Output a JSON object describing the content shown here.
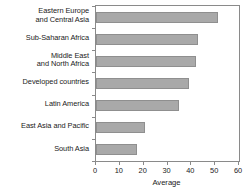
{
  "chart_data": {
    "type": "bar",
    "orientation": "horizontal",
    "title": "",
    "subtitle": "",
    "xlabel": "Average",
    "ylabel": "",
    "categories": [
      "Eastern Europe\nand Central Asia",
      "Sub-Saharan Africa",
      "Middle East\nand North Africa",
      "Developed countries",
      "Latin America",
      "East Asia and Pacific",
      "South Asia"
    ],
    "values": [
      51,
      43,
      42,
      39,
      35,
      20.5,
      17
    ],
    "xlim": [
      0,
      60
    ],
    "xticks": [
      0,
      10,
      20,
      30,
      40,
      50,
      60
    ],
    "xticklabels": [
      "0",
      "10",
      "20",
      "30",
      "40",
      "50",
      "60"
    ],
    "grid": false,
    "legend": false,
    "legend_position": "none",
    "bar_color": "#a9a9a9",
    "bar_edge_color": "#8f8f8f",
    "axis_color": "#8a8a8a",
    "background_color": "#ffffff"
  }
}
